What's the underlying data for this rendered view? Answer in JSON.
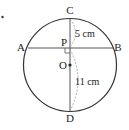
{
  "diagram": {
    "points": {
      "A": "A",
      "B": "B",
      "C": "C",
      "D": "D",
      "P": "P",
      "O": "O"
    },
    "measures": {
      "cp": "5 cm",
      "pd": "11 cm"
    },
    "colors": {
      "stroke": "#333333",
      "dashed": "#999999"
    }
  }
}
